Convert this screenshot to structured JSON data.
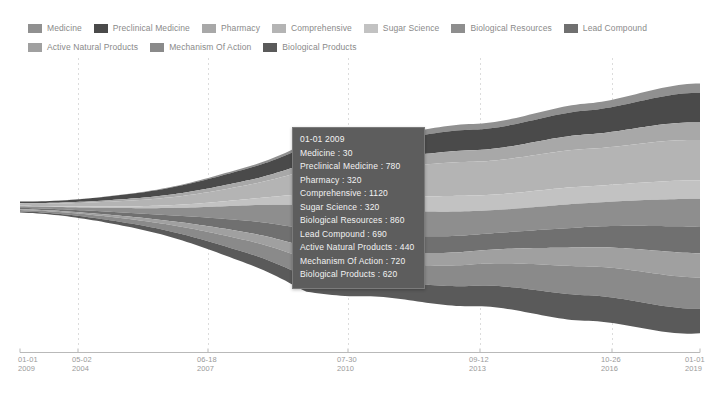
{
  "legend": {
    "items": [
      {
        "label": "Medicine",
        "color": "#909090"
      },
      {
        "label": "Preclinical Medicine",
        "color": "#4a4a4a"
      },
      {
        "label": "Pharmacy",
        "color": "#a8a8a8"
      },
      {
        "label": "Comprehensive",
        "color": "#b4b4b4"
      },
      {
        "label": "Sugar Science",
        "color": "#c2c2c2"
      },
      {
        "label": "Biological Resources",
        "color": "#8e8e8e"
      },
      {
        "label": "Lead Compound",
        "color": "#707070"
      },
      {
        "label": "Active Natural Products",
        "color": "#a0a0a0"
      },
      {
        "label": "Mechanism Of Action",
        "color": "#8a8a8a"
      },
      {
        "label": "Biological Products",
        "color": "#5a5a5a"
      }
    ]
  },
  "tooltip": {
    "title": "01-01 2009",
    "rows": [
      "Medicine : 30",
      "Preclinical Medicine : 780",
      "Pharmacy : 320",
      "Comprehensive : 1120",
      "Sugar Science : 320",
      "Biological Resources : 860",
      "Lead Compound : 690",
      "Active Natural Products : 440",
      "Mechanism Of Action : 720",
      "Biological Products : 620"
    ]
  },
  "axis": {
    "ticks": [
      {
        "top": "01-01",
        "bottom": "2009",
        "x": 18
      },
      {
        "top": "05-02",
        "bottom": "2004",
        "x": 72
      },
      {
        "top": "06-18",
        "bottom": "2007",
        "x": 197
      },
      {
        "top": "07-30",
        "bottom": "2010",
        "x": 337
      },
      {
        "top": "09-12",
        "bottom": "2013",
        "x": 469
      },
      {
        "top": "10-26",
        "bottom": "2016",
        "x": 601
      },
      {
        "top": "01-01",
        "bottom": "2019",
        "x": 685
      }
    ]
  },
  "chart_data": {
    "type": "area",
    "title": "",
    "xlabel": "",
    "ylabel": "",
    "stacked": true,
    "offset": "wiggle",
    "grid": true,
    "legend_position": "top",
    "x": [
      "01-01 2009",
      "05-02 2004",
      "06-18 2007",
      "07-30 2010",
      "09-12 2013",
      "10-26 2016",
      "01-01 2019"
    ],
    "series": [
      {
        "name": "Medicine",
        "color": "#909090",
        "values": [
          30,
          60,
          120,
          210,
          300,
          380,
          460
        ]
      },
      {
        "name": "Preclinical Medicine",
        "color": "#4a4a4a",
        "values": [
          780,
          830,
          900,
          1010,
          1180,
          1350,
          1520
        ]
      },
      {
        "name": "Pharmacy",
        "color": "#a8a8a8",
        "values": [
          320,
          360,
          430,
          520,
          640,
          760,
          880
        ]
      },
      {
        "name": "Comprehensive",
        "color": "#b4b4b4",
        "values": [
          1120,
          1180,
          1280,
          1420,
          1600,
          1790,
          1980
        ]
      },
      {
        "name": "Sugar Science",
        "color": "#c2c2c2",
        "values": [
          320,
          370,
          460,
          580,
          720,
          870,
          1020
        ]
      },
      {
        "name": "Biological Resources",
        "color": "#8e8e8e",
        "values": [
          860,
          920,
          1020,
          1160,
          1330,
          1510,
          1700
        ]
      },
      {
        "name": "Lead Compound",
        "color": "#707070",
        "values": [
          690,
          740,
          830,
          950,
          1100,
          1260,
          1430
        ]
      },
      {
        "name": "Active Natural Products",
        "color": "#a0a0a0",
        "values": [
          440,
          490,
          570,
          680,
          810,
          950,
          1100
        ]
      },
      {
        "name": "Mechanism Of Action",
        "color": "#8a8a8a",
        "values": [
          720,
          780,
          870,
          990,
          1140,
          1300,
          1470
        ]
      },
      {
        "name": "Biological Products",
        "color": "#5a5a5a",
        "values": [
          620,
          680,
          780,
          910,
          1070,
          1240,
          1420
        ]
      }
    ],
    "highlight": {
      "x": "01-01 2009",
      "values": [
        30,
        780,
        320,
        1120,
        320,
        860,
        690,
        440,
        720,
        620
      ]
    }
  }
}
